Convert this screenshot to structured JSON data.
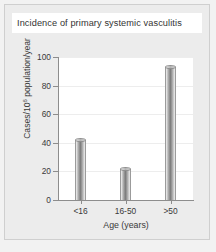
{
  "card": {
    "title": "Incidence of primary systemic vasculitis"
  },
  "chart_data": {
    "type": "bar",
    "title": "Incidence of primary systemic vasculitis",
    "categories": [
      "<16",
      "16-50",
      ">50"
    ],
    "values": [
      42,
      22,
      93
    ],
    "xlabel": "Age (years)",
    "ylabel": "Cases/10",
    "ylabel_sup": "6",
    "ylabel_tail": " population/year",
    "ylim": [
      0,
      100
    ],
    "yticks": [
      0,
      20,
      40,
      60,
      80,
      100
    ],
    "ytick_labels": [
      "0",
      "20",
      "40",
      "60",
      "80",
      "100"
    ],
    "grid": true,
    "legend": null,
    "bar_style": "3d-cylinder",
    "bar_color": "#8e8e8e",
    "plot_background": "#ffffff",
    "card_background": "#ececec"
  }
}
